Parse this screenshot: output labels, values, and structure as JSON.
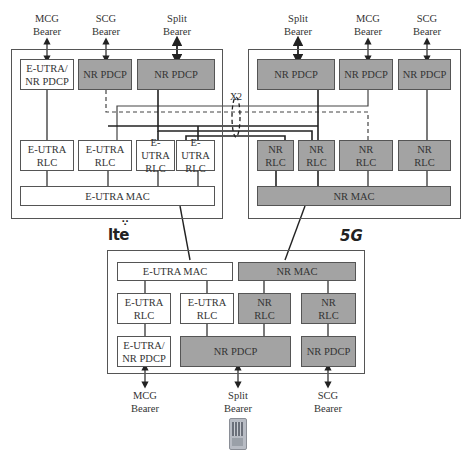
{
  "enb": {
    "bearers": [
      {
        "line1": "MCG",
        "line2": "Bearer"
      },
      {
        "line1": "SCG",
        "line2": "Bearer"
      },
      {
        "line1": "Split",
        "line2": "Bearer"
      }
    ],
    "pdcp": [
      {
        "line1": "E-UTRA/",
        "line2": "NR PDCP"
      },
      {
        "label": "NR PDCP"
      },
      {
        "label": "NR PDCP"
      }
    ],
    "rlc": [
      {
        "line1": "E-UTRA",
        "line2": "RLC"
      },
      {
        "line1": "E-UTRA",
        "line2": "RLC"
      },
      {
        "line1": "E-UTRA",
        "line2": "RLC"
      },
      {
        "line1": "E-UTRA",
        "line2": "RLC"
      }
    ],
    "mac": "E-UTRA MAC"
  },
  "gnb": {
    "bearers": [
      {
        "line1": "Split",
        "line2": "Bearer"
      },
      {
        "line1": "MCG",
        "line2": "Bearer"
      },
      {
        "line1": "SCG",
        "line2": "Bearer"
      }
    ],
    "pdcp": [
      {
        "label": "NR PDCP"
      },
      {
        "label": "NR PDCP"
      },
      {
        "label": "NR PDCP"
      }
    ],
    "rlc": [
      {
        "line1": "NR",
        "line2": "RLC"
      },
      {
        "line1": "NR",
        "line2": "RLC"
      },
      {
        "line1": "NR",
        "line2": "RLC"
      },
      {
        "line1": "NR",
        "line2": "RLC"
      }
    ],
    "mac": "NR MAC"
  },
  "x2_label": "X2",
  "logos": {
    "lte": "lte",
    "fiveg": "5G"
  },
  "ue": {
    "mac": [
      "E-UTRA MAC",
      "NR MAC"
    ],
    "rlc": [
      {
        "line1": "E-UTRA",
        "line2": "RLC"
      },
      {
        "line1": "E-UTRA",
        "line2": "RLC"
      },
      {
        "line1": "NR",
        "line2": "RLC"
      },
      {
        "line1": "NR",
        "line2": "RLC"
      }
    ],
    "pdcp": [
      {
        "line1": "E-UTRA/",
        "line2": "NR PDCP"
      },
      {
        "label": "NR PDCP"
      },
      {
        "label": "NR PDCP"
      }
    ],
    "bearers": [
      {
        "line1": "MCG",
        "line2": "Bearer"
      },
      {
        "line1": "Split",
        "line2": "Bearer"
      },
      {
        "line1": "SCG",
        "line2": "Bearer"
      }
    ]
  },
  "colors": {
    "gray_fill": "#a3a3a3",
    "line": "#222222",
    "border": "#555555"
  }
}
